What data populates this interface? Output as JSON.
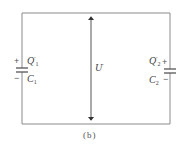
{
  "figure": {
    "caption": "(b)",
    "colors": {
      "wire": "#8a8a8a",
      "arrow": "#333333",
      "text": "#444444"
    }
  },
  "capacitors": [
    {
      "id": "C1",
      "side": "left",
      "charge_label": "Q",
      "charge_prime": "′",
      "charge_sub": "1",
      "cap_label": "C",
      "cap_sub": "1",
      "top_sign": "+",
      "bottom_sign": "−"
    },
    {
      "id": "C2",
      "side": "right",
      "charge_label": "Q",
      "charge_prime": "′",
      "charge_sub": "2",
      "cap_label": "C",
      "cap_sub": "2",
      "top_sign": "+",
      "bottom_sign": "−"
    }
  ],
  "voltage": {
    "label": "U",
    "prime": "′"
  }
}
